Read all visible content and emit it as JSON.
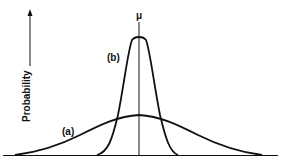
{
  "figure": {
    "y_axis_label": "Probability",
    "mean_symbol": "μ",
    "curve_a_label": "(a)",
    "curve_b_label": "(b)"
  },
  "colors": {
    "stroke": "#111111",
    "background": "#ffffff"
  }
}
